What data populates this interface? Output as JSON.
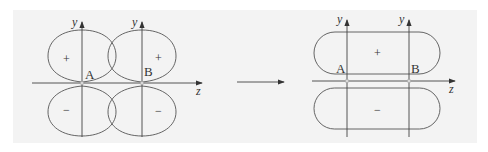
{
  "colors": {
    "background": "#ffffff",
    "panel": "#f3f3f3",
    "stroke": "#555555",
    "node": "#d8d8d8"
  },
  "left_diagram": {
    "title": "separate p orbitals",
    "y_axis_labels": [
      "y",
      "y"
    ],
    "z_axis_label": "z",
    "nuclei": [
      "A",
      "B"
    ],
    "upper_signs": [
      "+",
      "+"
    ],
    "lower_signs": [
      "−",
      "−"
    ]
  },
  "arrow": {
    "label": ""
  },
  "right_diagram": {
    "title": "pi bonding orbital",
    "y_axis_labels": [
      "y",
      "y"
    ],
    "z_axis_label": "z",
    "nuclei": [
      "A",
      "B"
    ],
    "upper_sign": "+",
    "lower_sign": "−"
  }
}
